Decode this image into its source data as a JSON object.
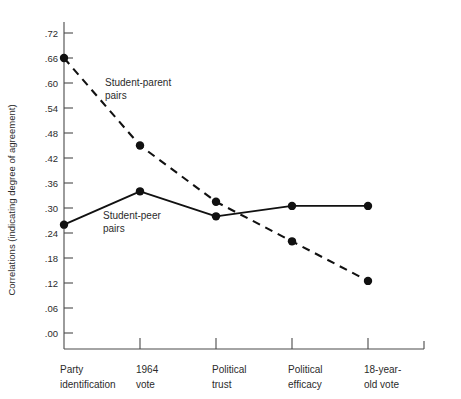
{
  "chart_data": {
    "type": "line",
    "title": "",
    "xlabel": "",
    "ylabel": "Correlations (indicating degree of agreement)",
    "categories": [
      "Party identification",
      "1964 vote",
      "Political trust",
      "Political efficacy",
      "18-year-old vote"
    ],
    "category_lines": [
      [
        "Party",
        "identification"
      ],
      [
        "1964",
        "vote"
      ],
      [
        "Political",
        "trust"
      ],
      [
        "Political",
        "efficacy"
      ],
      [
        "18-year-",
        "old vote"
      ]
    ],
    "ylim": [
      0.0,
      0.72
    ],
    "yticks": [
      0.0,
      0.06,
      0.12,
      0.18,
      0.24,
      0.3,
      0.36,
      0.42,
      0.48,
      0.54,
      0.6,
      0.66,
      0.72
    ],
    "ytick_labels": [
      ".00",
      ".06",
      ".12",
      ".18",
      ".24",
      ".30",
      ".36",
      ".42",
      ".48",
      ".54",
      ".60",
      ".66",
      ".72"
    ],
    "grid": false,
    "legend_position": "inline-annotations",
    "series": [
      {
        "name": "Student-parent pairs",
        "style": "dashed",
        "marker": "filled-circle",
        "color": "#111111",
        "values": [
          0.66,
          0.45,
          0.315,
          0.22,
          0.125
        ],
        "annotation_lines": [
          "Student-parent",
          "pairs"
        ]
      },
      {
        "name": "Student-peer pairs",
        "style": "solid",
        "marker": "filled-circle",
        "color": "#111111",
        "values": [
          0.26,
          0.34,
          0.28,
          0.305,
          0.305
        ],
        "annotation_lines": [
          "Student-peer",
          "pairs"
        ]
      }
    ]
  },
  "colors": {
    "background": "#ffffff",
    "axis": "#4a4a4a",
    "data": "#111111",
    "text": "#2b2b2b"
  }
}
